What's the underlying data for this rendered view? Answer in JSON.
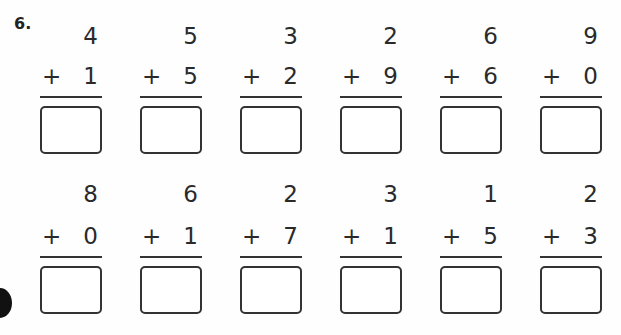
{
  "exercise": {
    "number_label": "6.",
    "operator": "+",
    "rows": [
      {
        "problems": [
          {
            "top": "4",
            "addend": "1",
            "answer": ""
          },
          {
            "top": "5",
            "addend": "5",
            "answer": ""
          },
          {
            "top": "3",
            "addend": "2",
            "answer": ""
          },
          {
            "top": "2",
            "addend": "9",
            "answer": ""
          },
          {
            "top": "6",
            "addend": "6",
            "answer": ""
          },
          {
            "top": "9",
            "addend": "0",
            "answer": ""
          }
        ]
      },
      {
        "problems": [
          {
            "top": "8",
            "addend": "0",
            "answer": ""
          },
          {
            "top": "6",
            "addend": "1",
            "answer": ""
          },
          {
            "top": "2",
            "addend": "7",
            "answer": ""
          },
          {
            "top": "3",
            "addend": "1",
            "answer": ""
          },
          {
            "top": "1",
            "addend": "5",
            "answer": ""
          },
          {
            "top": "2",
            "addend": "3",
            "answer": ""
          }
        ]
      }
    ]
  }
}
